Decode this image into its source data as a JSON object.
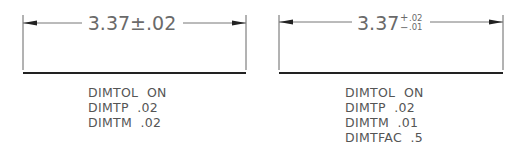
{
  "figures": [
    {
      "id": "left",
      "dimension": {
        "base": "3.37",
        "symbol": "±",
        "tolerance": ".02"
      },
      "settings": [
        "DIMTOL  ON",
        "DIMTP  .02",
        "DIMTM  .02"
      ]
    },
    {
      "id": "right",
      "dimension": {
        "base": "3.37",
        "plus_sign": "+",
        "minus_sign": "−",
        "upper_tolerance": ".02",
        "lower_tolerance": ".01"
      },
      "settings": [
        "DIMTOL  ON",
        "DIMTP  .02",
        "DIMTM  .01",
        "DIMTFAC  .5"
      ]
    }
  ],
  "colors": {
    "line": "#555555",
    "base_line": "#222222",
    "text": "#6a6a6a"
  }
}
